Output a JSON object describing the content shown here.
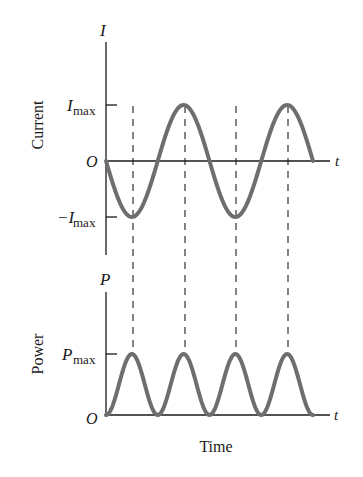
{
  "chart_data": [
    {
      "type": "line",
      "title": "",
      "ylabel": "Current",
      "xlabel": "",
      "y_axis_symbol": "I",
      "x_axis_symbol": "t",
      "origin_label": "O",
      "tick_labels": {
        "max": "I",
        "max_sub": "max",
        "min": "−I",
        "min_sub": "max"
      },
      "series": [
        {
          "name": "I(t) = -Imax sin(ωt)",
          "x": [
            0,
            0.25,
            0.5,
            0.75,
            1.0,
            1.25,
            1.5,
            1.75,
            2.0,
            2.25,
            2.5,
            2.75,
            3.0,
            3.25,
            3.5,
            3.75,
            4.0
          ],
          "values": [
            0,
            -0.71,
            -1,
            -0.71,
            0,
            0.71,
            1,
            0.71,
            0,
            -0.71,
            -1,
            -0.71,
            0,
            0.71,
            1,
            0.71,
            0
          ]
        }
      ],
      "ylim": [
        -1,
        1
      ],
      "grid": false
    },
    {
      "type": "line",
      "title": "",
      "ylabel": "Power",
      "xlabel": "Time",
      "y_axis_symbol": "P",
      "x_axis_symbol": "t",
      "origin_label": "O",
      "tick_labels": {
        "max": "P",
        "max_sub": "max"
      },
      "series": [
        {
          "name": "P(t) = Pmax sin²(ωt)",
          "x": [
            0,
            0.5,
            1.0,
            1.5,
            2.0,
            2.5,
            3.0,
            3.5,
            4.0,
            4.5,
            5.0,
            5.5,
            6.0,
            6.5,
            7.0,
            7.5,
            8.0
          ],
          "values": [
            0,
            0.5,
            1,
            0.5,
            0,
            0.5,
            1,
            0.5,
            0,
            0.5,
            1,
            0.5,
            0,
            0.5,
            1,
            0.5,
            0
          ]
        }
      ],
      "ylim": [
        0,
        1
      ],
      "grid": false
    }
  ],
  "labels": {
    "current_axis": "Current",
    "power_axis": "Power",
    "time_axis": "Time",
    "I_symbol": "I",
    "P_symbol": "P",
    "t_symbol": "t",
    "origin": "O",
    "max_sub": "max",
    "I_max": "I",
    "neg_I_max": "−I",
    "P_max": "P"
  },
  "colors": {
    "curve": "#6e6e6e",
    "axis": "#1a1a1a",
    "dash": "#333333"
  }
}
